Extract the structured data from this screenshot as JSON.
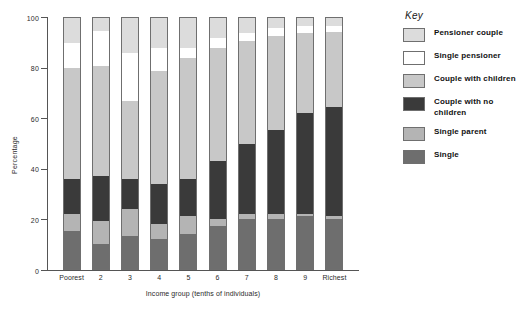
{
  "chart_data": {
    "type": "bar",
    "subtype": "stacked-bar-100",
    "title": "",
    "xlabel": "Income group (tenths of individuals)",
    "ylabel": "Percentage",
    "ylim": [
      0,
      100
    ],
    "yticks": [
      0,
      20,
      40,
      60,
      80,
      100
    ],
    "grid": false,
    "legend_position": "right",
    "legend_title": "Key",
    "categories": [
      "Poorest",
      "2",
      "3",
      "4",
      "5",
      "6",
      "7",
      "8",
      "9",
      "Richest"
    ],
    "series": [
      {
        "name": "Single",
        "color": "#6e6e6e",
        "values": [
          15,
          10,
          13,
          12,
          14,
          17,
          20,
          20,
          21,
          20
        ]
      },
      {
        "name": "Single parent",
        "color": "#b4b4b4",
        "values": [
          7,
          9,
          11,
          6,
          7,
          3,
          2,
          2,
          1,
          1
        ]
      },
      {
        "name": "Couple with no children",
        "color": "#3a3a3a",
        "values": [
          14,
          18,
          12,
          16,
          15,
          23,
          28,
          33.5,
          40,
          43.5
        ]
      },
      {
        "name": "Couple with children",
        "color": "#c8c8c8",
        "values": [
          44,
          44,
          31,
          45,
          48,
          45,
          41,
          37.5,
          32,
          30
        ]
      },
      {
        "name": "Single pensioner",
        "color": "#ffffff",
        "values": [
          10,
          14,
          19,
          9,
          4,
          4,
          3,
          3,
          3,
          2.5
        ]
      },
      {
        "name": "Pensioner couple",
        "color": "#dcdcdc",
        "values": [
          10,
          5,
          14,
          12,
          12,
          8,
          6,
          4,
          3,
          3
        ]
      }
    ],
    "cumulative_tops": {
      "Poorest": [
        15,
        22,
        36,
        80,
        90,
        100
      ],
      "2": [
        10,
        19,
        37,
        81,
        95,
        100
      ],
      "3": [
        13,
        24,
        36,
        67,
        86,
        100
      ],
      "4": [
        12,
        18,
        34,
        79,
        88,
        100
      ],
      "5": [
        14,
        21,
        36,
        84,
        88,
        100
      ],
      "6": [
        17,
        20,
        43,
        88,
        92,
        100
      ],
      "7": [
        20,
        22,
        50,
        91,
        94,
        100
      ],
      "8": [
        20,
        22,
        55.5,
        93,
        96,
        100
      ],
      "9": [
        21,
        22,
        62,
        94,
        97,
        100
      ],
      "Richest": [
        20,
        21,
        64.5,
        94.5,
        97,
        100
      ]
    }
  },
  "axes": {
    "y_title": "Percentage",
    "x_title": "Income group (tenths of individuals)",
    "y_tick_labels": [
      "0",
      "20",
      "40",
      "60",
      "80",
      "100"
    ],
    "x_tick_labels": [
      "Poorest",
      "2",
      "3",
      "4",
      "5",
      "6",
      "7",
      "8",
      "9",
      "Richest"
    ]
  },
  "legend": {
    "title": "Key",
    "items": [
      {
        "label": "Pensioner couple",
        "color": "#dcdcdc"
      },
      {
        "label": "Single pensioner",
        "color": "#ffffff"
      },
      {
        "label": "Couple with children",
        "color": "#c8c8c8"
      },
      {
        "label": "Couple with no children",
        "color": "#3a3a3a"
      },
      {
        "label": "Single parent",
        "color": "#b4b4b4"
      },
      {
        "label": "Single",
        "color": "#6e6e6e"
      }
    ]
  },
  "colors": {
    "axis": "#555555",
    "bar_outline": "#6f6f6f",
    "background": "#ffffff",
    "text": "#1a1a1a"
  }
}
